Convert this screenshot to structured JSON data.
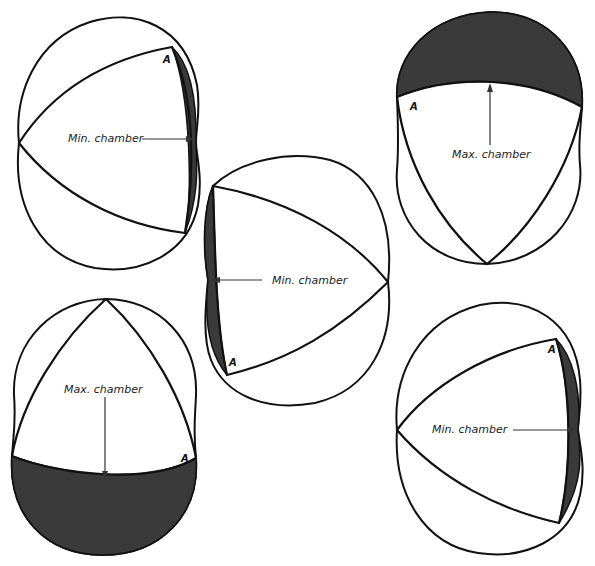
{
  "figure": {
    "colors": {
      "outline": "#111111",
      "shaded_chamber": "#3a3a3a",
      "background": "#ffffff"
    },
    "panels": [
      {
        "id": "top-left",
        "label": "Min. chamber",
        "apex_label": "A",
        "chamber_state": "minimum"
      },
      {
        "id": "top-right",
        "label": "Max. chamber",
        "apex_label": "A",
        "chamber_state": "maximum"
      },
      {
        "id": "center",
        "label": "Min. chamber",
        "apex_label": "A",
        "chamber_state": "minimum"
      },
      {
        "id": "bottom-left",
        "label": "Max. chamber",
        "apex_label": "A",
        "chamber_state": "maximum"
      },
      {
        "id": "bottom-right",
        "label": "Min. chamber",
        "apex_label": "A",
        "chamber_state": "minimum"
      }
    ]
  }
}
